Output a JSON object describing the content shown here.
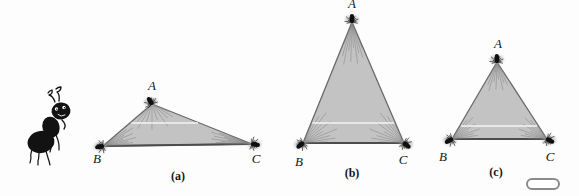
{
  "figure": {
    "background": "#fdfdfd",
    "triangle_fill": "#c3c3c3",
    "edge_color": "#6a6a6a",
    "base_edge_color": "#4c4c4c",
    "strand_color": "#7d7d7d",
    "white_line_color": "#f8f8f8",
    "label_color": "#151515",
    "ant_color": "#101010",
    "triangles": [
      {
        "id": "a",
        "caption": "(a)",
        "vertex_labels": [
          "A",
          "B",
          "C"
        ],
        "vertices": {
          "A": [
            152,
            104
          ],
          "B": [
            103,
            146
          ],
          "C": [
            252,
            144
          ]
        },
        "label_positions": {
          "A": [
            152,
            90
          ],
          "B": [
            97,
            163
          ],
          "C": [
            256,
            163
          ]
        },
        "caption_position": [
          178,
          180
        ],
        "white_line_y": 123
      },
      {
        "id": "b",
        "caption": "(b)",
        "vertex_labels": [
          "A",
          "B",
          "C"
        ],
        "vertices": {
          "A": [
            352,
            22
          ],
          "B": [
            303,
            143
          ],
          "C": [
            404,
            143
          ]
        },
        "label_positions": {
          "A": [
            352,
            8
          ],
          "B": [
            299,
            166
          ],
          "C": [
            403,
            164
          ]
        },
        "caption_position": [
          352,
          177
        ],
        "white_line_y": 123
      },
      {
        "id": "c",
        "caption": "(c)",
        "vertex_labels": [
          "A",
          "B",
          "C"
        ],
        "vertices": {
          "A": [
            497,
            62
          ],
          "B": [
            452,
            139
          ],
          "C": [
            547,
            139
          ]
        },
        "label_positions": {
          "A": [
            498,
            48
          ],
          "B": [
            443,
            161
          ],
          "C": [
            550,
            161
          ]
        },
        "caption_position": [
          496,
          176
        ],
        "white_line_y": 126
      }
    ],
    "pill": {
      "x": 527,
      "y": 179,
      "width": 32,
      "height": 10,
      "stroke": "#8a8a8a",
      "fill": "#ffffff"
    }
  }
}
